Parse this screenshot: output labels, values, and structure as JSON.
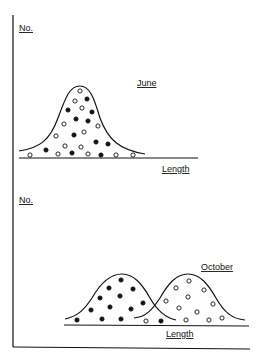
{
  "panels": [
    {
      "id": "june",
      "y_axis_label": "No.",
      "x_axis_label": "Length",
      "curve_label": "June",
      "description": "Single bell-shaped length distribution containing mixed filled and open dots"
    },
    {
      "id": "october",
      "y_axis_label": "No.",
      "x_axis_label": "Length",
      "curve_label": "October",
      "description": "Two separated bell-shaped distributions: filled dots (smaller lengths) and open dots (larger lengths)"
    }
  ],
  "legend": {
    "filled_dot": "filled",
    "open_dot": "open"
  },
  "colors": {
    "ink": "#111111",
    "background": "#ffffff"
  }
}
